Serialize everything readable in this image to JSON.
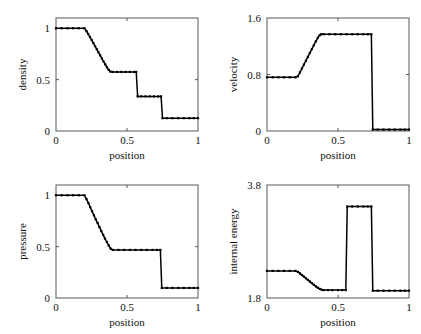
{
  "chart_data": [
    {
      "id": "density",
      "type": "line",
      "title": "",
      "xlabel": "position",
      "ylabel": "density",
      "xlim": [
        0,
        1
      ],
      "ylim": [
        0,
        1.1
      ],
      "xticks": [
        0,
        0.5,
        1
      ],
      "xticklabels": [
        "0",
        "0.5",
        "1"
      ],
      "yticks": [
        0,
        0.5,
        1
      ],
      "yticklabels": [
        "0",
        "0.5",
        "1"
      ],
      "grid": false,
      "legend": "none",
      "markers": true,
      "x": [
        0.0,
        0.04,
        0.08,
        0.12,
        0.16,
        0.2,
        0.215,
        0.227,
        0.239,
        0.251,
        0.263,
        0.275,
        0.287,
        0.299,
        0.311,
        0.323,
        0.335,
        0.347,
        0.359,
        0.371,
        0.383,
        0.4,
        0.43,
        0.46,
        0.49,
        0.52,
        0.55,
        0.565,
        0.575,
        0.6,
        0.63,
        0.66,
        0.69,
        0.72,
        0.74,
        0.75,
        0.78,
        0.82,
        0.86,
        0.9,
        0.94,
        0.97,
        1.0
      ],
      "y": [
        1.0,
        1.0,
        1.0,
        1.0,
        1.0,
        1.0,
        0.972,
        0.944,
        0.915,
        0.886,
        0.856,
        0.826,
        0.796,
        0.766,
        0.736,
        0.706,
        0.676,
        0.648,
        0.62,
        0.595,
        0.578,
        0.575,
        0.575,
        0.575,
        0.575,
        0.575,
        0.575,
        0.575,
        0.337,
        0.337,
        0.337,
        0.337,
        0.337,
        0.337,
        0.337,
        0.125,
        0.125,
        0.125,
        0.125,
        0.125,
        0.125,
        0.125,
        0.125
      ]
    },
    {
      "id": "velocity",
      "type": "line",
      "title": "",
      "xlabel": "position",
      "ylabel": "velocity",
      "xlim": [
        0,
        1
      ],
      "ylim": [
        0,
        1.6
      ],
      "xticks": [
        0,
        0.5,
        1
      ],
      "xticklabels": [
        "0",
        "0.5",
        "1"
      ],
      "yticks": [
        0,
        0.8,
        1.6
      ],
      "yticklabels": [
        "0",
        "0.8",
        "1.6"
      ],
      "grid": false,
      "legend": "none",
      "markers": true,
      "x": [
        0.0,
        0.04,
        0.08,
        0.12,
        0.16,
        0.2,
        0.218,
        0.232,
        0.246,
        0.26,
        0.274,
        0.288,
        0.302,
        0.316,
        0.33,
        0.344,
        0.358,
        0.37,
        0.382,
        0.4,
        0.44,
        0.48,
        0.52,
        0.56,
        0.6,
        0.64,
        0.68,
        0.71,
        0.735,
        0.745,
        0.78,
        0.82,
        0.86,
        0.9,
        0.94,
        0.97,
        1.0
      ],
      "y": [
        0.76,
        0.76,
        0.76,
        0.76,
        0.76,
        0.76,
        0.775,
        0.83,
        0.885,
        0.94,
        0.995,
        1.05,
        1.105,
        1.16,
        1.215,
        1.27,
        1.32,
        1.355,
        1.37,
        1.37,
        1.37,
        1.37,
        1.37,
        1.37,
        1.37,
        1.37,
        1.37,
        1.37,
        1.37,
        0.02,
        0.02,
        0.02,
        0.02,
        0.02,
        0.02,
        0.02,
        0.02
      ]
    },
    {
      "id": "pressure",
      "type": "line",
      "title": "",
      "xlabel": "position",
      "ylabel": "pressure",
      "xlim": [
        0,
        1
      ],
      "ylim": [
        0,
        1.1
      ],
      "xticks": [
        0,
        0.5,
        1
      ],
      "xticklabels": [
        "0",
        "0.5",
        "1"
      ],
      "yticks": [
        0,
        0.5,
        1
      ],
      "yticklabels": [
        "0",
        "0.5",
        "1"
      ],
      "grid": false,
      "legend": "none",
      "markers": true,
      "x": [
        0.0,
        0.04,
        0.08,
        0.12,
        0.16,
        0.2,
        0.215,
        0.228,
        0.241,
        0.254,
        0.267,
        0.28,
        0.293,
        0.306,
        0.319,
        0.332,
        0.345,
        0.358,
        0.371,
        0.385,
        0.4,
        0.44,
        0.48,
        0.52,
        0.56,
        0.6,
        0.64,
        0.68,
        0.71,
        0.735,
        0.745,
        0.78,
        0.82,
        0.86,
        0.9,
        0.94,
        0.97,
        1.0
      ],
      "y": [
        1.0,
        1.0,
        1.0,
        1.0,
        1.0,
        1.0,
        0.962,
        0.925,
        0.885,
        0.845,
        0.805,
        0.765,
        0.73,
        0.69,
        0.652,
        0.615,
        0.578,
        0.545,
        0.512,
        0.48,
        0.468,
        0.468,
        0.468,
        0.468,
        0.468,
        0.468,
        0.468,
        0.468,
        0.468,
        0.468,
        0.098,
        0.098,
        0.098,
        0.098,
        0.098,
        0.098,
        0.098,
        0.098
      ]
    },
    {
      "id": "internal-energy",
      "type": "line",
      "title": "",
      "xlabel": "position",
      "ylabel": "internal energy",
      "xlim": [
        0,
        1
      ],
      "ylim": [
        1.8,
        3.8
      ],
      "xticks": [
        0,
        0.5,
        1
      ],
      "xticklabels": [
        "0",
        "0.5",
        "1"
      ],
      "yticks": [
        1.8,
        3.8
      ],
      "yticklabels": [
        "1.8",
        "3.8"
      ],
      "grid": false,
      "legend": "none",
      "markers": true,
      "x": [
        0.0,
        0.04,
        0.08,
        0.12,
        0.16,
        0.2,
        0.218,
        0.232,
        0.246,
        0.26,
        0.274,
        0.288,
        0.302,
        0.316,
        0.33,
        0.344,
        0.358,
        0.372,
        0.386,
        0.4,
        0.43,
        0.46,
        0.5,
        0.53,
        0.555,
        0.565,
        0.6,
        0.64,
        0.68,
        0.71,
        0.735,
        0.745,
        0.78,
        0.82,
        0.86,
        0.9,
        0.94,
        0.97,
        1.0
      ],
      "y": [
        2.28,
        2.28,
        2.28,
        2.28,
        2.28,
        2.28,
        2.262,
        2.235,
        2.206,
        2.178,
        2.149,
        2.12,
        2.091,
        2.063,
        2.034,
        2.005,
        1.982,
        1.96,
        1.946,
        1.94,
        1.94,
        1.94,
        1.94,
        1.94,
        1.94,
        3.42,
        3.42,
        3.42,
        3.42,
        3.42,
        3.42,
        1.93,
        1.93,
        1.93,
        1.93,
        1.93,
        1.93,
        1.93,
        1.93
      ]
    }
  ]
}
